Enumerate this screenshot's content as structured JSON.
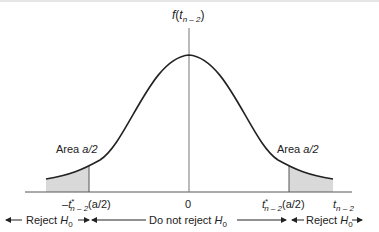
{
  "diagram": {
    "type": "two-tailed t-distribution rejection regions",
    "y_axis_label": {
      "func": "f",
      "var": "t",
      "sub": "n – 2"
    },
    "x_axis_label": {
      "var": "t",
      "sub": "n – 2"
    },
    "center_tick": "0",
    "left_critical": {
      "prefix": "–",
      "var": "t",
      "sup": "*",
      "sub": "n – 2",
      "arg": "(a/2)"
    },
    "right_critical": {
      "var": "t",
      "sup": "*",
      "sub": "n – 2",
      "arg": "(a/2)"
    },
    "left_area": {
      "word": "Area ",
      "value": "a/2"
    },
    "right_area": {
      "word": "Area ",
      "value": "a/2"
    },
    "regions": {
      "left": {
        "text": "Reject ",
        "h": "H",
        "hsub": "0"
      },
      "middle": {
        "text": "Do not reject ",
        "h": "H",
        "hsub": "0"
      },
      "right": {
        "text": "Reject ",
        "h": "H",
        "hsub": "0"
      }
    },
    "colors": {
      "curve": "#222222",
      "axis": "#555555",
      "shade": "#d9d9d9",
      "text": "#222222"
    }
  }
}
